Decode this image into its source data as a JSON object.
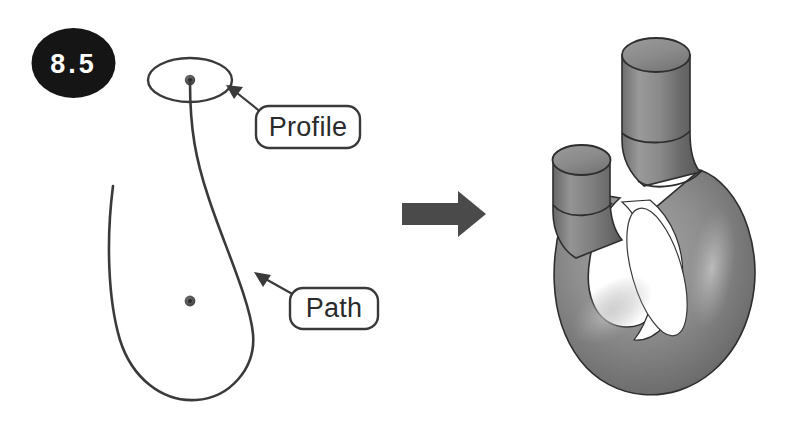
{
  "figure": {
    "badge": {
      "label": "8.5",
      "shape": "ellipse",
      "fill_color": "#151515",
      "text_color": "#ffffff"
    },
    "left_diagram": {
      "title_hidden": "",
      "profile_callout": {
        "label": "Profile",
        "box_stroke": "#3a3a3a",
        "text_color": "#2b2b2b"
      },
      "path_callout": {
        "label": "Path",
        "box_stroke": "#3a3a3a",
        "text_color": "#2b2b2b"
      },
      "profile_shape": "ellipse-outline",
      "path_shape": "hook-curve",
      "curve_color": "#3a3a3a",
      "origin_marker": "center-point-dot"
    },
    "transition_arrow": {
      "direction": "right",
      "color": "#4a4a4a"
    },
    "right_model": {
      "description": "swept-hook-solid",
      "body_color_light": "#b9b9b9",
      "body_color_dark": "#5e5e5e",
      "cap_color": "#8d8d8d",
      "outline_color": "#2e2e2e"
    }
  }
}
